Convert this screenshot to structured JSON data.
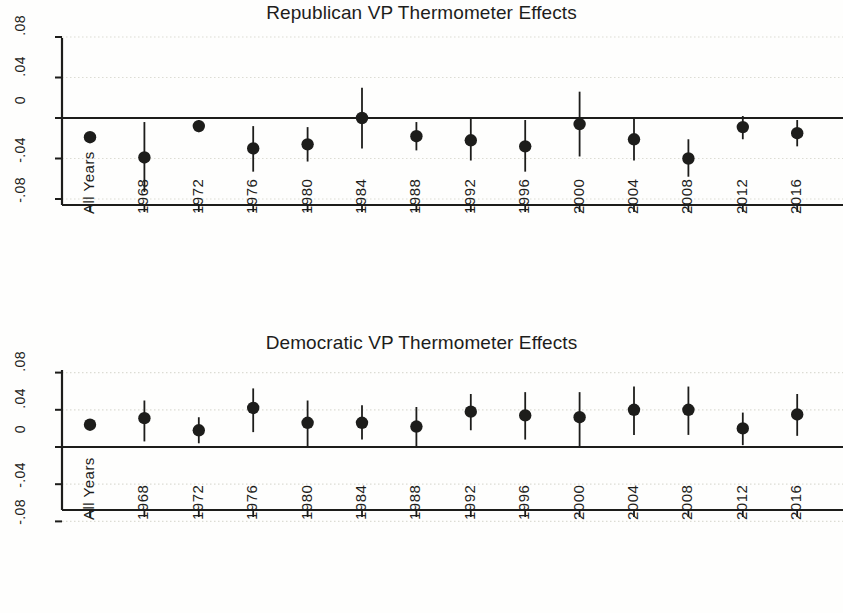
{
  "figure": {
    "background_color": "#fefefd",
    "ink_color": "#1d1d1b",
    "gridline_color": "#dcdcd4"
  },
  "chart_data": [
    {
      "type": "scatter",
      "panel_id": "republican",
      "title": "Republican VP Thermometer Effects",
      "xlabel": "",
      "ylabel": "",
      "ylim": [
        -0.105,
        0.095
      ],
      "yticks": [
        0.08,
        0.04,
        0,
        -0.04,
        -0.08
      ],
      "ytick_labels": [
        ".08",
        ".04",
        "0",
        "-.04",
        "-.08"
      ],
      "grid": true,
      "zero_line": 0,
      "categories": [
        "All Years",
        "1968",
        "1972",
        "1976",
        "1980",
        "1984",
        "1988",
        "1992",
        "1996",
        "2000",
        "2004",
        "2008",
        "2012",
        "2016"
      ],
      "series": [
        {
          "name": "Republican VP thermometer effect",
          "values": [
            -0.019,
            -0.039,
            -0.008,
            -0.03,
            -0.026,
            0.0,
            -0.018,
            -0.022,
            -0.028,
            -0.006,
            -0.021,
            -0.04,
            -0.009,
            -0.015
          ],
          "ci_low": [
            -0.019,
            -0.073,
            -0.014,
            -0.053,
            -0.043,
            -0.03,
            -0.032,
            -0.042,
            -0.053,
            -0.038,
            -0.042,
            -0.058,
            -0.021,
            -0.028
          ],
          "ci_high": [
            -0.019,
            -0.004,
            -0.002,
            -0.008,
            -0.009,
            0.03,
            -0.004,
            -0.001,
            -0.002,
            0.026,
            0.0,
            -0.021,
            0.002,
            -0.002
          ]
        }
      ]
    },
    {
      "type": "scatter",
      "panel_id": "democratic",
      "title": "Democratic VP Thermometer Effects",
      "xlabel": "",
      "ylabel": "",
      "ylim": [
        -0.105,
        0.095
      ],
      "yticks": [
        0.08,
        0.04,
        0,
        -0.04,
        -0.08
      ],
      "ytick_labels": [
        ".08",
        ".04",
        "0",
        "-.04",
        "-.08"
      ],
      "grid": true,
      "zero_line": 0,
      "categories": [
        "All Years",
        "1968",
        "1972",
        "1976",
        "1980",
        "1984",
        "1988",
        "1992",
        "1996",
        "2000",
        "2004",
        "2008",
        "2012",
        "2016"
      ],
      "series": [
        {
          "name": "Democratic VP thermometer effect",
          "values": [
            0.024,
            0.031,
            0.018,
            0.042,
            0.026,
            0.026,
            0.022,
            0.038,
            0.034,
            0.032,
            0.04,
            0.04,
            0.02,
            0.035
          ],
          "ci_low": [
            0.024,
            0.006,
            0.004,
            0.016,
            0.001,
            0.008,
            0.0,
            0.018,
            0.008,
            0.0,
            0.013,
            0.013,
            0.002,
            0.012
          ],
          "ci_high": [
            0.024,
            0.05,
            0.032,
            0.063,
            0.05,
            0.045,
            0.043,
            0.057,
            0.059,
            0.059,
            0.065,
            0.065,
            0.037,
            0.057
          ]
        }
      ]
    }
  ]
}
